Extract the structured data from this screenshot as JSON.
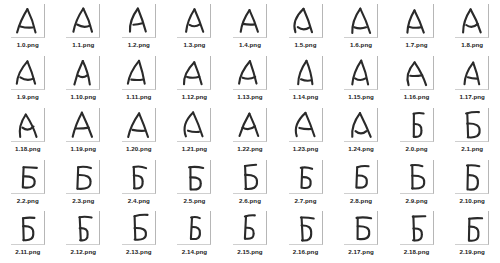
{
  "gallery": {
    "columns": 9,
    "rows": 5,
    "background_color": "#ffffff",
    "thumbnail_border_color": "#b6b6b6",
    "ink_color": "#2a2a2a",
    "caption_color": "#1b1b1b",
    "items": [
      {
        "filename": "1.0.png",
        "letter": "А",
        "variant": 0
      },
      {
        "filename": "1.1.png",
        "letter": "А",
        "variant": 1
      },
      {
        "filename": "1.2.png",
        "letter": "А",
        "variant": 2
      },
      {
        "filename": "1.3.png",
        "letter": "А",
        "variant": 3
      },
      {
        "filename": "1.4.png",
        "letter": "А",
        "variant": 4
      },
      {
        "filename": "1.5.png",
        "letter": "А",
        "variant": 5
      },
      {
        "filename": "1.6.png",
        "letter": "А",
        "variant": 6
      },
      {
        "filename": "1.7.png",
        "letter": "А",
        "variant": 7
      },
      {
        "filename": "1.8.png",
        "letter": "А",
        "variant": 8
      },
      {
        "filename": "1.9.png",
        "letter": "А",
        "variant": 9
      },
      {
        "filename": "1.10.png",
        "letter": "А",
        "variant": 10
      },
      {
        "filename": "1.11.png",
        "letter": "А",
        "variant": 11
      },
      {
        "filename": "1.12.png",
        "letter": "А",
        "variant": 12
      },
      {
        "filename": "1.13.png",
        "letter": "А",
        "variant": 13
      },
      {
        "filename": "1.14.png",
        "letter": "А",
        "variant": 14
      },
      {
        "filename": "1.15.png",
        "letter": "А",
        "variant": 15
      },
      {
        "filename": "1.16.png",
        "letter": "А",
        "variant": 16
      },
      {
        "filename": "1.17.png",
        "letter": "А",
        "variant": 17
      },
      {
        "filename": "1.18.png",
        "letter": "А",
        "variant": 18
      },
      {
        "filename": "1.19.png",
        "letter": "А",
        "variant": 19
      },
      {
        "filename": "1.20.png",
        "letter": "А",
        "variant": 20
      },
      {
        "filename": "1.21.png",
        "letter": "А",
        "variant": 21
      },
      {
        "filename": "1.22.png",
        "letter": "А",
        "variant": 22
      },
      {
        "filename": "1.23.png",
        "letter": "А",
        "variant": 23
      },
      {
        "filename": "1.24.png",
        "letter": "А",
        "variant": 24
      },
      {
        "filename": "2.0.png",
        "letter": "Б",
        "variant": 0
      },
      {
        "filename": "2.1.png",
        "letter": "Б",
        "variant": 1
      },
      {
        "filename": "2.2.png",
        "letter": "Б",
        "variant": 2
      },
      {
        "filename": "2.3.png",
        "letter": "Б",
        "variant": 3
      },
      {
        "filename": "2.4.png",
        "letter": "Б",
        "variant": 4
      },
      {
        "filename": "2.5.png",
        "letter": "Б",
        "variant": 5
      },
      {
        "filename": "2.6.png",
        "letter": "Б",
        "variant": 6
      },
      {
        "filename": "2.7.png",
        "letter": "Б",
        "variant": 7
      },
      {
        "filename": "2.8.png",
        "letter": "Б",
        "variant": 8
      },
      {
        "filename": "2.9.png",
        "letter": "Б",
        "variant": 9
      },
      {
        "filename": "2.10.png",
        "letter": "Б",
        "variant": 10
      },
      {
        "filename": "2.11.png",
        "letter": "Б",
        "variant": 11
      },
      {
        "filename": "2.12.png",
        "letter": "Б",
        "variant": 12
      },
      {
        "filename": "2.13.png",
        "letter": "Б",
        "variant": 13
      },
      {
        "filename": "2.14.png",
        "letter": "Б",
        "variant": 14
      },
      {
        "filename": "2.15.png",
        "letter": "Б",
        "variant": 15
      },
      {
        "filename": "2.16.png",
        "letter": "Б",
        "variant": 16
      },
      {
        "filename": "2.17.png",
        "letter": "Б",
        "variant": 17
      },
      {
        "filename": "2.18.png",
        "letter": "Б",
        "variant": 18
      },
      {
        "filename": "2.19.png",
        "letter": "Б",
        "variant": 19
      }
    ]
  }
}
